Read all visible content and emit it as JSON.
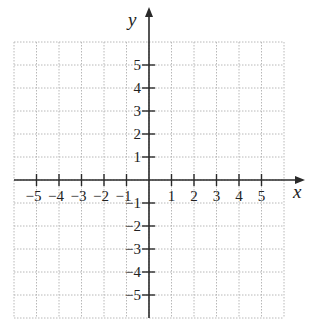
{
  "chart_data": {
    "type": "scatter",
    "title": "",
    "xlabel": "x",
    "ylabel": "y",
    "xlim": [
      -6,
      6
    ],
    "ylim": [
      -6,
      6
    ],
    "grid": true,
    "grid_style": "dotted",
    "x_ticks": [
      -5,
      -4,
      -3,
      -2,
      -1,
      1,
      2,
      3,
      4,
      5
    ],
    "y_ticks": [
      -5,
      -4,
      -3,
      -2,
      -1,
      1,
      2,
      3,
      4,
      5
    ],
    "x_tick_labels": [
      "−5",
      "−4",
      "−3",
      "−2",
      "−1",
      "1",
      "2",
      "3",
      "4",
      "5"
    ],
    "y_tick_labels": [
      "−5",
      "−4",
      "−3",
      "−2",
      "−1",
      "1",
      "2",
      "3",
      "4",
      "5"
    ],
    "series": [],
    "legend": null
  },
  "colors": {
    "axis": "#2a2a2a",
    "grid": "#b8b8b8",
    "text": "#222222",
    "background": "#ffffff"
  }
}
